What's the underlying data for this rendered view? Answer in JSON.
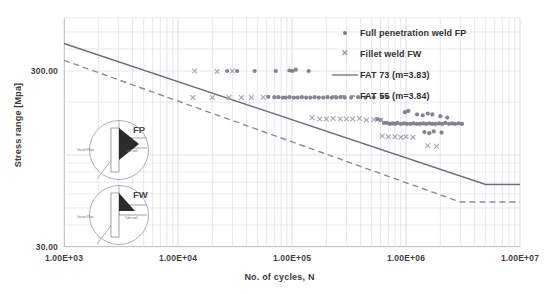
{
  "chart_data": {
    "type": "scatter",
    "title": "",
    "xlabel": "No. of cycles, N",
    "ylabel": "Stress range [Mpa]",
    "xscale": "log",
    "yscale": "log",
    "xlim": [
      1000,
      10000000
    ],
    "ylim": [
      30,
      600
    ],
    "grid": true,
    "xticks": [
      "1.00E+03",
      "1.00E+04",
      "1.00E+05",
      "1.00E+06",
      "1.00E+07"
    ],
    "xtick_values": [
      1000,
      10000,
      100000,
      1000000,
      10000000
    ],
    "yticks": [
      "300.00",
      "30.00"
    ],
    "ytick_values": [
      300,
      30
    ],
    "legend_position": "top-right",
    "legend": [
      {
        "label": "Full penetration weld FP",
        "marker": "dot",
        "color": "#7b7b86"
      },
      {
        "label": "Fillet weld FW",
        "marker": "x",
        "color": "#9a9aa6"
      },
      {
        "label": "FAT 73 (m=3.83)",
        "marker": "solid-line",
        "color": "#6f6f7a"
      },
      {
        "label": "FAT 55 (m=3.84)",
        "marker": "dashed-line",
        "color": "#8c8c98"
      }
    ],
    "series": [
      {
        "name": "Full penetration weld FP",
        "marker": "dot",
        "color": "#7b7b86",
        "points": [
          [
            27000,
            300
          ],
          [
            33000,
            300
          ],
          [
            47000,
            300
          ],
          [
            72000,
            300
          ],
          [
            95000,
            302
          ],
          [
            101000,
            300
          ],
          [
            108000,
            305
          ],
          [
            140000,
            300
          ],
          [
            62000,
            214
          ],
          [
            70000,
            213
          ],
          [
            76000,
            213
          ],
          [
            83000,
            212
          ],
          [
            88000,
            212
          ],
          [
            95000,
            213
          ],
          [
            104000,
            212
          ],
          [
            112000,
            212
          ],
          [
            122000,
            213
          ],
          [
            133000,
            212
          ],
          [
            145000,
            212
          ],
          [
            158000,
            213
          ],
          [
            172000,
            212
          ],
          [
            188000,
            212
          ],
          [
            205000,
            213
          ],
          [
            224000,
            212
          ],
          [
            244000,
            212
          ],
          [
            266000,
            213
          ],
          [
            290000,
            212
          ],
          [
            330000,
            212
          ],
          [
            380000,
            213
          ],
          [
            440000,
            212
          ],
          [
            520000,
            212
          ],
          [
            620000,
            214
          ],
          [
            690000,
            213
          ],
          [
            560000,
            160
          ],
          [
            600000,
            158
          ],
          [
            640000,
            152
          ],
          [
            680000,
            152
          ],
          [
            720000,
            150
          ],
          [
            760000,
            151
          ],
          [
            800000,
            150
          ],
          [
            840000,
            152
          ],
          [
            900000,
            150
          ],
          [
            960000,
            151
          ],
          [
            1020000,
            150
          ],
          [
            1090000,
            150
          ],
          [
            1160000,
            151
          ],
          [
            1240000,
            150
          ],
          [
            1320000,
            150
          ],
          [
            1410000,
            151
          ],
          [
            1500000,
            150
          ],
          [
            1600000,
            151
          ],
          [
            1700000,
            150
          ],
          [
            1820000,
            150
          ],
          [
            1950000,
            151
          ],
          [
            2080000,
            150
          ],
          [
            2220000,
            152
          ],
          [
            2380000,
            150
          ],
          [
            2550000,
            151
          ],
          [
            2700000,
            150
          ],
          [
            2900000,
            151
          ],
          [
            3100000,
            150
          ],
          [
            1250000,
            170
          ],
          [
            1400000,
            168
          ],
          [
            1550000,
            172
          ],
          [
            1700000,
            170
          ],
          [
            2000000,
            166
          ],
          [
            2300000,
            163
          ],
          [
            1450000,
            135
          ],
          [
            1600000,
            133
          ],
          [
            1750000,
            136
          ],
          [
            2050000,
            134
          ],
          [
            980000,
            175
          ],
          [
            1050000,
            178
          ]
        ]
      },
      {
        "name": "Fillet weld FW",
        "marker": "x",
        "color": "#9a9aa6",
        "points": [
          [
            14000,
            300
          ],
          [
            22000,
            298
          ],
          [
            30000,
            300
          ],
          [
            13500,
            212
          ],
          [
            20000,
            212
          ],
          [
            28000,
            212
          ],
          [
            36000,
            212
          ],
          [
            44000,
            212
          ],
          [
            56000,
            213
          ],
          [
            150000,
            163
          ],
          [
            175000,
            160
          ],
          [
            200000,
            160
          ],
          [
            230000,
            161
          ],
          [
            265000,
            160
          ],
          [
            300000,
            160
          ],
          [
            340000,
            160
          ],
          [
            390000,
            161
          ],
          [
            450000,
            158
          ],
          [
            520000,
            159
          ],
          [
            600000,
            158
          ],
          [
            620000,
            128
          ],
          [
            700000,
            127
          ],
          [
            800000,
            127
          ],
          [
            900000,
            126
          ],
          [
            1000000,
            127
          ],
          [
            1150000,
            126
          ],
          [
            1550000,
            113
          ],
          [
            1850000,
            112
          ]
        ]
      }
    ],
    "curves": [
      {
        "name": "FAT 73 (m=3.83)",
        "style": "solid",
        "color": "#6f6f7a",
        "m": 3.83,
        "fat": 73,
        "points": [
          [
            1000,
            430
          ],
          [
            5000000,
            68
          ],
          [
            10000000,
            68
          ]
        ]
      },
      {
        "name": "FAT 55 (m=3.84)",
        "style": "dashed",
        "color": "#8c8c98",
        "m": 3.84,
        "fat": 55,
        "points": [
          [
            1000,
            345
          ],
          [
            3000000,
            54
          ],
          [
            10000000,
            54
          ]
        ]
      }
    ]
  },
  "insets": [
    {
      "name": "FP",
      "label": "FP",
      "weld_type": "full-penetration",
      "part_left": "Gusset Plate",
      "part_right": "Tube wall"
    },
    {
      "name": "FW",
      "label": "FW",
      "weld_type": "fillet",
      "part_left": "Gusset Plate",
      "part_right": "Tube wall"
    }
  ],
  "axes": {
    "x_title": "No. of cycles, N",
    "y_title": "Stress range [Mpa]"
  }
}
